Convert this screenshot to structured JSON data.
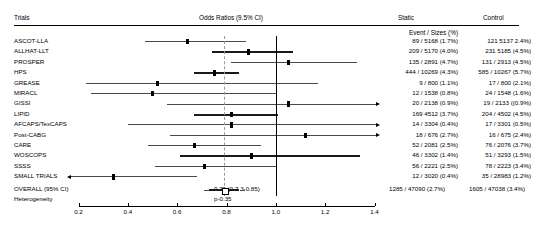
{
  "header": {
    "trials_label": "Trials",
    "odds_label": "Odds Ratios (9.5% CI)",
    "static_label": "Static",
    "control_label": "Control",
    "event_sizes_label": "Event / Sizes (%)"
  },
  "summary": {
    "overall_label": "OVERALL (95% CI)",
    "overall_value": "0.79 (0.7 3-0.85)",
    "heterogeneity_label": "Heterogeneity",
    "p_value": "p-0.35",
    "static": "1285 / 47090 (2.7%)",
    "control": "1605 / 47038 (3.4%)"
  },
  "chart_data": {
    "type": "forest",
    "title": "Odds Ratios (9.5% CI)",
    "xlabel": "",
    "xlim": [
      0.2,
      1.4
    ],
    "xticks": [
      "0.2",
      "0.4",
      "0.6",
      "0.8",
      "1.0",
      "1.2",
      "1.4"
    ],
    "xtick_values": [
      0.2,
      0.4,
      0.6,
      0.8,
      1.0,
      1.2,
      1.4
    ],
    "null_line": 1.0,
    "pooled_line": 0.79,
    "grid": false,
    "columns": [
      "Trials",
      "Odds Ratios (9.5% CI)",
      "Static",
      "Control"
    ],
    "rows": [
      {
        "trial": "ASCOT-LLA",
        "or": 0.64,
        "lo": 0.47,
        "hi": 0.88,
        "static": "89 / 5168 (1.7%)",
        "control": "121 5137 2.4%)",
        "left_arrow": false,
        "right_arrow": false,
        "bold": false
      },
      {
        "trial": "ALLHAT-LLT",
        "or": 0.89,
        "lo": 0.74,
        "hi": 1.07,
        "static": "209 / 5170 (4.0%)",
        "control": "231 5185 (4.5%)",
        "left_arrow": false,
        "right_arrow": false,
        "bold": true
      },
      {
        "trial": "PROSPER",
        "or": 1.05,
        "lo": 0.82,
        "hi": 1.33,
        "static": "135 / 2891 (4.7%)",
        "control": "131 / 2913 (4.5%)",
        "left_arrow": false,
        "right_arrow": false,
        "bold": false
      },
      {
        "trial": "HPS",
        "or": 0.75,
        "lo": 0.67,
        "hi": 0.85,
        "static": "444 / 10269 (4.3%)",
        "control": "585 / 10267 (5.7%)",
        "left_arrow": false,
        "right_arrow": false,
        "bold": true
      },
      {
        "trial": "GREASE",
        "or": 0.52,
        "lo": 0.23,
        "hi": 1.17,
        "static": "9 / 800 (1.1%)",
        "control": "17 / 800 (2.1%)",
        "left_arrow": false,
        "right_arrow": false,
        "bold": false
      },
      {
        "trial": "MIRACL",
        "or": 0.5,
        "lo": 0.25,
        "hi": 1.0,
        "static": "12 / 1538 (0.8%)",
        "control": "24 / 1548 (1.6%)",
        "left_arrow": false,
        "right_arrow": false,
        "bold": false
      },
      {
        "trial": "GISSI",
        "or": 1.05,
        "lo": 0.56,
        "hi": 1.99,
        "static": "20 / 2138 (0.9%)",
        "control": "19 / 2133 ((0.9%)",
        "left_arrow": false,
        "right_arrow": true,
        "bold": false
      },
      {
        "trial": "LIPID",
        "or": 0.82,
        "lo": 0.67,
        "hi": 1.01,
        "static": "169 4512 (3.7%)",
        "control": "204 / 4502 (4.5%)",
        "left_arrow": false,
        "right_arrow": false,
        "bold": true
      },
      {
        "trial": "AFCAPS/TexCAPS",
        "or": 0.82,
        "lo": 0.4,
        "hi": 1.67,
        "static": "14 / 3304 (0.4%)",
        "control": "17 / 3301 (0.5%)",
        "left_arrow": false,
        "right_arrow": true,
        "bold": false
      },
      {
        "trial": "Post-CABG",
        "or": 1.12,
        "lo": 0.57,
        "hi": 2.21,
        "static": "18 / 676 (2.7%)",
        "control": "16 / 675 (2.4%)",
        "left_arrow": false,
        "right_arrow": true,
        "bold": false
      },
      {
        "trial": "CARE",
        "or": 0.67,
        "lo": 0.48,
        "hi": 0.94,
        "static": "52 / 2081 (2.5%)",
        "control": "76 / 2076 (3.7%)",
        "left_arrow": false,
        "right_arrow": false,
        "bold": false
      },
      {
        "trial": "WOSCOPS",
        "or": 0.9,
        "lo": 0.61,
        "hi": 1.34,
        "static": "46 / 3302 (1.4%)",
        "control": "51 / 3293 (1.5%)",
        "left_arrow": false,
        "right_arrow": false,
        "bold": true
      },
      {
        "trial": "SSSS",
        "or": 0.71,
        "lo": 0.51,
        "hi": 1.0,
        "static": "56 / 2221 (2.5%)",
        "control": "78 / 2223 (3.4%)",
        "left_arrow": false,
        "right_arrow": false,
        "bold": false
      },
      {
        "trial": "SMALL TRIALS",
        "or": 0.34,
        "lo": 0.17,
        "hi": 0.68,
        "static": "12 / 3020 (0.4%)",
        "control": "35 / 28983 (1.2%)",
        "left_arrow": true,
        "right_arrow": false,
        "bold": false
      }
    ],
    "overall": {
      "or": 0.79,
      "lo": 0.73,
      "hi": 0.85,
      "label": "OVERALL (95% CI)",
      "value": "0.79 (0.7 3-0.85)",
      "static": "1285 / 47090 (2.7%)",
      "control": "1605 / 47038 (3.4%)"
    }
  }
}
